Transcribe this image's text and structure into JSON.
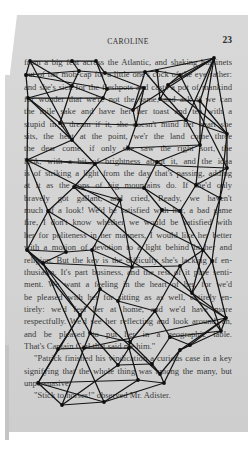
{
  "page": {
    "running_title": "CAROLINE",
    "page_number": "23",
    "lines": [
      {
        "text": "from a big feat across the Atlantic, and shaking bassinets",
        "style": ""
      },
      {
        "text": "out of her mob-cap for a little one's cock of the eye rather:",
        "style": ""
      },
      {
        "text": "and she's sick for the fleshpots and casts a pot of mankind",
        "style": ""
      },
      {
        "text": "for wonder that we're not the same, and ask if we can",
        "style": ""
      },
      {
        "text": "the mile sake and have her her toast and tea with a",
        "style": ""
      },
      {
        "text": "stupid in a dream if it, she doesn't mind her heart she",
        "style": ""
      },
      {
        "text": "sits, the heat at the point, we'r the land come three",
        "style": ""
      },
      {
        "text": "the dear come, if only she saw the right sort, the",
        "style": ""
      },
      {
        "text": "look, with a bit of brightness about it, and the idea",
        "style": ""
      },
      {
        "text": "is of striking a light from the day that's passing, adding",
        "style": ""
      },
      {
        "text": "at it as the tops of big mountains do. If she'd only",
        "style": ""
      },
      {
        "text": "bravely got gallant, and cried, Ready, we haven't",
        "style": ""
      },
      {
        "text": "much of a look! We'd be satisfied with her, a bad game",
        "style": ""
      },
      {
        "text": "fire, I don't know whether we would be satisfied with",
        "style": ""
      },
      {
        "text": "her for politeness in her manners, I would like her better",
        "style": ""
      },
      {
        "text": "with a motion of devotion to a light behind in her and",
        "style": ""
      },
      {
        "text": "religion. But the key is the difficulty she's lacking of en-",
        "style": ""
      },
      {
        "text": "thusiasm. It's part business, and the rest of it pure senti-",
        "style": ""
      },
      {
        "text": "ment. We want a feeling in the heart of her, for we'd",
        "style": ""
      },
      {
        "text": "be pleased with her for sitting as as well, entirely en-",
        "style": ""
      },
      {
        "text": "tirely: we'd feel her at home, and we'd have more",
        "style": ""
      },
      {
        "text": "respectfully. We'd see her reflecting and look around, an,",
        "style": ""
      },
      {
        "text": "and be pleased to put her in a geographic table.",
        "style": ""
      },
      {
        "text": "That's Captain Carl that said me him.\"",
        "style": "last"
      },
      {
        "text": "\"Patrick finished his vindication a curious case in a key",
        "style": "indent"
      },
      {
        "text": "signifying that the whole thing was among the many, but",
        "style": ""
      },
      {
        "text": "unpersuasive.",
        "style": "last"
      },
      {
        "text": "\"Stick to horses!\" observed Mr. Adister.",
        "style": "indent last"
      }
    ]
  },
  "drawing": {
    "stroke_color": "#141414",
    "node_color": "#0e0e0e",
    "nodes": [
      [
        30,
        61
      ],
      [
        72,
        61
      ],
      [
        96,
        61
      ],
      [
        214,
        58
      ],
      [
        26,
        75
      ],
      [
        79,
        71
      ],
      [
        105,
        73
      ],
      [
        145,
        72
      ],
      [
        157,
        71
      ],
      [
        180,
        75
      ],
      [
        72,
        86
      ],
      [
        107,
        89
      ],
      [
        144,
        88
      ],
      [
        168,
        85
      ],
      [
        28,
        98
      ],
      [
        103,
        98
      ],
      [
        133,
        110
      ],
      [
        160,
        99
      ],
      [
        200,
        101
      ],
      [
        60,
        123
      ],
      [
        136,
        125
      ],
      [
        186,
        120
      ],
      [
        227,
        134
      ],
      [
        72,
        140
      ],
      [
        128,
        148
      ],
      [
        200,
        145
      ],
      [
        27,
        160
      ],
      [
        95,
        164
      ],
      [
        157,
        162
      ],
      [
        227,
        168
      ],
      [
        74,
        187
      ],
      [
        144,
        188
      ],
      [
        196,
        185
      ],
      [
        162,
        210
      ],
      [
        120,
        200
      ],
      [
        48,
        211
      ],
      [
        180,
        211
      ],
      [
        220,
        198
      ],
      [
        27,
        250
      ],
      [
        66,
        252
      ],
      [
        92,
        250
      ],
      [
        203,
        250
      ],
      [
        43,
        263
      ],
      [
        132,
        267
      ],
      [
        212,
        261
      ],
      [
        180,
        266
      ],
      [
        100,
        289
      ],
      [
        118,
        301
      ],
      [
        192,
        293
      ],
      [
        80,
        315
      ],
      [
        155,
        311
      ],
      [
        226,
        318
      ],
      [
        90,
        333
      ],
      [
        130,
        342
      ],
      [
        221,
        331
      ],
      [
        170,
        337
      ],
      [
        190,
        345
      ],
      [
        58,
        349
      ],
      [
        84,
        348
      ],
      [
        129,
        348
      ],
      [
        180,
        350
      ],
      [
        118,
        365
      ],
      [
        152,
        364
      ],
      [
        160,
        374
      ],
      [
        38,
        383
      ],
      [
        138,
        380
      ],
      [
        164,
        383
      ],
      [
        62,
        405
      ],
      [
        104,
        402
      ]
    ],
    "edges": [
      [
        0,
        1
      ],
      [
        0,
        4
      ],
      [
        0,
        10
      ],
      [
        1,
        2
      ],
      [
        1,
        5
      ],
      [
        2,
        6
      ],
      [
        2,
        11
      ],
      [
        3,
        9
      ],
      [
        3,
        7
      ],
      [
        3,
        13
      ],
      [
        3,
        18
      ],
      [
        3,
        21
      ],
      [
        3,
        22
      ],
      [
        3,
        25
      ],
      [
        4,
        5
      ],
      [
        4,
        14
      ],
      [
        4,
        11
      ],
      [
        5,
        10
      ],
      [
        5,
        6
      ],
      [
        6,
        12
      ],
      [
        6,
        7
      ],
      [
        7,
        8
      ],
      [
        7,
        16
      ],
      [
        8,
        9
      ],
      [
        8,
        17
      ],
      [
        9,
        13
      ],
      [
        9,
        29
      ],
      [
        10,
        14
      ],
      [
        10,
        15
      ],
      [
        10,
        19
      ],
      [
        11,
        15
      ],
      [
        11,
        12
      ],
      [
        12,
        16
      ],
      [
        12,
        20
      ],
      [
        13,
        17
      ],
      [
        13,
        22
      ],
      [
        14,
        15
      ],
      [
        14,
        19
      ],
      [
        14,
        26
      ],
      [
        14,
        23
      ],
      [
        15,
        16
      ],
      [
        15,
        23
      ],
      [
        16,
        20
      ],
      [
        17,
        21
      ],
      [
        17,
        18
      ],
      [
        18,
        22
      ],
      [
        18,
        25
      ],
      [
        19,
        23
      ],
      [
        19,
        20
      ],
      [
        20,
        24
      ],
      [
        20,
        21
      ],
      [
        21,
        22
      ],
      [
        21,
        25
      ],
      [
        22,
        29
      ],
      [
        22,
        37
      ],
      [
        23,
        26
      ],
      [
        23,
        27
      ],
      [
        24,
        27
      ],
      [
        24,
        28
      ],
      [
        24,
        25
      ],
      [
        25,
        28
      ],
      [
        25,
        32
      ],
      [
        26,
        27
      ],
      [
        26,
        29
      ],
      [
        26,
        35
      ],
      [
        26,
        38
      ],
      [
        27,
        30
      ],
      [
        27,
        34
      ],
      [
        28,
        31
      ],
      [
        28,
        32
      ],
      [
        29,
        32
      ],
      [
        29,
        37
      ],
      [
        30,
        35
      ],
      [
        30,
        31
      ],
      [
        30,
        34
      ],
      [
        31,
        33
      ],
      [
        31,
        36
      ],
      [
        32,
        36
      ],
      [
        32,
        37
      ],
      [
        33,
        36
      ],
      [
        33,
        43
      ],
      [
        34,
        40
      ],
      [
        34,
        43
      ],
      [
        35,
        39
      ],
      [
        35,
        38
      ],
      [
        36,
        41
      ],
      [
        37,
        41
      ],
      [
        37,
        44
      ],
      [
        38,
        39
      ],
      [
        38,
        42
      ],
      [
        38,
        49
      ],
      [
        39,
        40
      ],
      [
        39,
        42
      ],
      [
        40,
        46
      ],
      [
        40,
        43
      ],
      [
        41,
        44
      ],
      [
        41,
        45
      ],
      [
        41,
        48
      ],
      [
        42,
        43
      ],
      [
        42,
        49
      ],
      [
        43,
        45
      ],
      [
        43,
        47
      ],
      [
        44,
        51
      ],
      [
        44,
        48
      ],
      [
        45,
        48
      ],
      [
        45,
        50
      ],
      [
        46,
        47
      ],
      [
        46,
        49
      ],
      [
        46,
        52
      ],
      [
        47,
        50
      ],
      [
        47,
        53
      ],
      [
        48,
        51
      ],
      [
        48,
        54
      ],
      [
        49,
        52
      ],
      [
        49,
        57
      ],
      [
        49,
        64
      ],
      [
        50,
        55
      ],
      [
        50,
        53
      ],
      [
        51,
        54
      ],
      [
        51,
        56
      ],
      [
        51,
        60
      ],
      [
        51,
        58
      ],
      [
        52,
        53
      ],
      [
        52,
        58
      ],
      [
        52,
        61
      ],
      [
        53,
        59
      ],
      [
        53,
        62
      ],
      [
        54,
        55
      ],
      [
        54,
        60
      ],
      [
        55,
        56
      ],
      [
        55,
        62
      ],
      [
        56,
        60
      ],
      [
        57,
        58
      ],
      [
        57,
        64
      ],
      [
        58,
        59
      ],
      [
        58,
        67
      ],
      [
        59,
        61
      ],
      [
        59,
        65
      ],
      [
        60,
        66
      ],
      [
        60,
        63
      ],
      [
        61,
        62
      ],
      [
        61,
        67
      ],
      [
        62,
        63
      ],
      [
        63,
        66
      ],
      [
        64,
        65
      ],
      [
        64,
        67
      ],
      [
        64,
        68
      ],
      [
        65,
        66
      ],
      [
        65,
        68
      ],
      [
        66,
        68
      ],
      [
        67,
        68
      ],
      [
        0,
        23
      ],
      [
        3,
        16
      ],
      [
        7,
        21
      ],
      [
        26,
        41
      ],
      [
        35,
        51
      ],
      [
        30,
        48
      ],
      [
        38,
        63
      ],
      [
        42,
        68
      ],
      [
        36,
        54
      ]
    ]
  }
}
